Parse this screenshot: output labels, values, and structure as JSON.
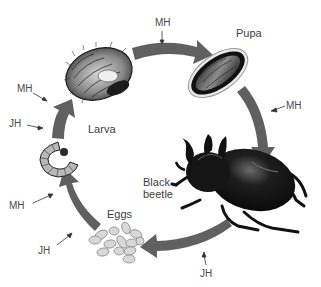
{
  "diagram": {
    "type": "life-cycle",
    "arrow_color": "#606060",
    "stages": [
      {
        "id": "eggs",
        "label": "Eggs"
      },
      {
        "id": "larva",
        "label": "Larva"
      },
      {
        "id": "pupa",
        "label": "Pupa"
      },
      {
        "id": "adult",
        "label": "Black\nbeetle",
        "line1": "Black",
        "line2": "beetle"
      }
    ],
    "hormones": {
      "mh": "MH",
      "jh": "JH"
    },
    "annotations": [
      {
        "label": "MH",
        "position": "top, between larva and pupa"
      },
      {
        "label": "MH",
        "position": "right, between pupa and adult"
      },
      {
        "label": "JH",
        "position": "bottom, between adult and eggs"
      },
      {
        "label": "JH",
        "position": "left-bottom, between eggs and small larva"
      },
      {
        "label": "MH",
        "position": "left, between eggs and small larva"
      },
      {
        "label": "JH",
        "position": "left, between small and large larva"
      },
      {
        "label": "MH",
        "position": "left-top, between small and large larva"
      }
    ]
  }
}
